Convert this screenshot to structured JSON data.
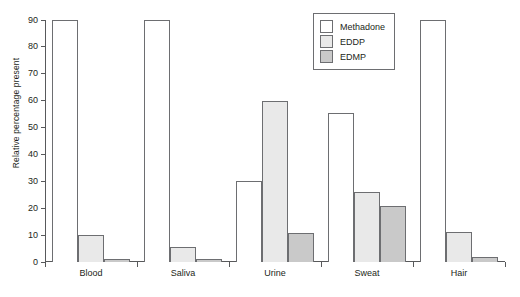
{
  "chart_data": {
    "type": "bar",
    "title": "",
    "xlabel": "",
    "ylabel": "Relative percentage present",
    "categories": [
      "Blood",
      "Saliva",
      "Urine",
      "Sweat",
      "Hair"
    ],
    "series": [
      {
        "name": "Methadone",
        "color": "#ffffff",
        "values": [
          90,
          90,
          30,
          55.5,
          90
        ]
      },
      {
        "name": "EDDP",
        "color": "#e9e9e9",
        "values": [
          10,
          5.5,
          60,
          26,
          11
        ]
      },
      {
        "name": "EDMP",
        "color": "#c9c9c9",
        "values": [
          1.2,
          1.2,
          10.8,
          21,
          2
        ]
      }
    ],
    "ylim": [
      0,
      90
    ],
    "yticks": [
      0,
      10,
      20,
      30,
      40,
      50,
      60,
      70,
      80,
      90
    ],
    "ytick_labels": [
      "0",
      "10",
      "20",
      "30",
      "40",
      "50",
      "60",
      "70",
      "80",
      "90"
    ],
    "grid": false,
    "legend_position": "top-right",
    "axis_color": "#58595b",
    "bar_outline_color": "#6d6e71"
  }
}
